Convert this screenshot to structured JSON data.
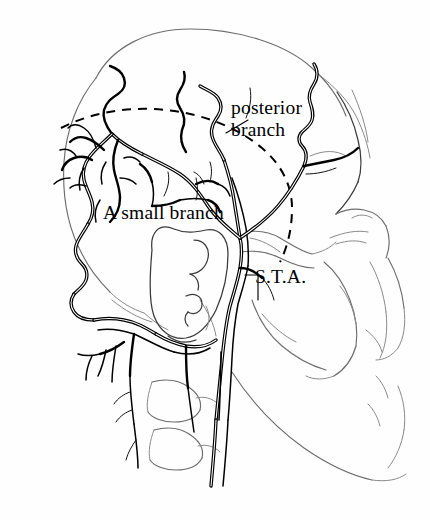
{
  "figure": {
    "background_color": "#fefefe",
    "ink_color": "#000000",
    "bone_outline_color": "#6e6e6e",
    "width": 430,
    "height": 520
  },
  "labels": {
    "posterior_branch_line1": "posterior",
    "posterior_branch_line2": "branch",
    "small_branch": "A small branch",
    "sta": "S.T.A."
  },
  "annotations": {
    "incision_name": "dashed-scalp-flap-incision-line",
    "leader_posterior_branch": "leader-line-posterior-branch",
    "leader_sta": "leader-line-sta"
  },
  "structures": {
    "cranial_vault": "cranial-vault-outline",
    "auricle": "ear-auricle",
    "zygomatic_arch": "zygomatic-arch",
    "orbit": "orbital-rim",
    "maxilla": "maxilla",
    "mandible": "mandible",
    "cervical_vertebrae": "cervical-vertebrae",
    "occipital_artery": "occipital-artery",
    "superficial_temporal_artery": "superficial-temporal-artery",
    "frontal_branch": "frontal-branch-artery",
    "posterior_branch_vessel": "posterior-branch-artery",
    "carotid_trunk": "carotid-trunk"
  }
}
